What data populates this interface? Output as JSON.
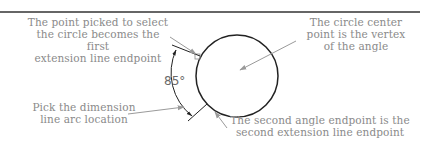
{
  "diagram": {
    "colors": {
      "geometry": "#222222",
      "leader": "#9a9a9a",
      "annotation_text": "#8a8a8a",
      "dimension_text": "#6a6a6a",
      "background": "#ffffff"
    },
    "annotations": {
      "first_point": "The point picked to select\nthe circle becomes the first\nextension line endpoint",
      "vertex": "The circle center\npoint is the vertex\nof the angle",
      "arc_location": "Pick the dimension\nline arc location",
      "second_point": "The second angle endpoint is the\nsecond extension line endpoint"
    },
    "dimension": {
      "value": "85°"
    }
  }
}
